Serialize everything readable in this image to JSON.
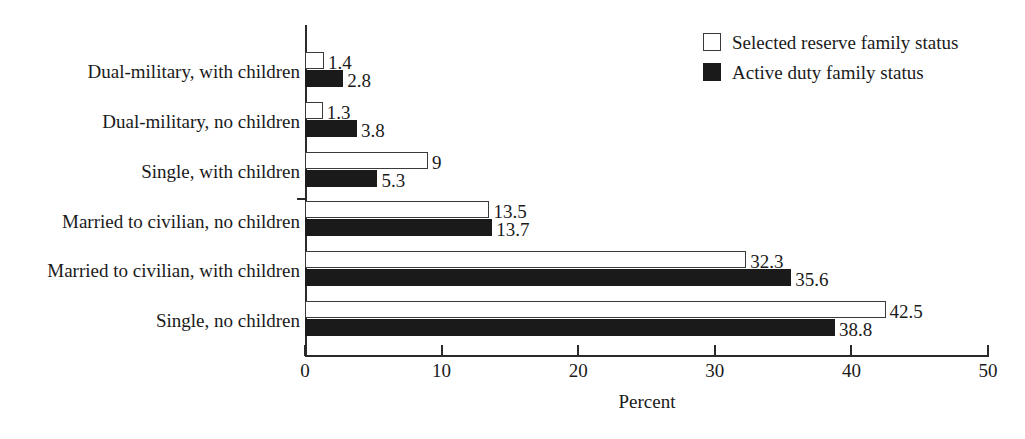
{
  "chart_data": {
    "type": "bar",
    "orientation": "horizontal",
    "title": "",
    "xlabel": "Percent",
    "ylabel": "",
    "xlim": [
      0,
      50
    ],
    "xticks": [
      0,
      10,
      20,
      30,
      40,
      50
    ],
    "xtick_labels": [
      "0",
      "10",
      "20",
      "30",
      "40",
      "50"
    ],
    "grid": false,
    "legend_position": "top-right",
    "categories": [
      "Dual-military, with children",
      "Dual-military, no children",
      "Single, with children",
      "Married to civilian, no children",
      "Married to civilian, with children",
      "Single, no children"
    ],
    "series": [
      {
        "name": "Selected reserve family status",
        "style": "open",
        "color": "#ffffff",
        "edge_color": "#3a3a3a",
        "values": [
          1.4,
          1.3,
          9,
          13.5,
          32.3,
          42.5
        ],
        "value_labels": [
          "1.4",
          "1.3",
          "9",
          "13.5",
          "32.3",
          "42.5"
        ]
      },
      {
        "name": "Active duty family status",
        "style": "filled",
        "color": "#1a1a1a",
        "edge_color": "#1a1a1a",
        "values": [
          2.8,
          3.8,
          5.3,
          13.7,
          35.6,
          38.8
        ],
        "value_labels": [
          "2.8",
          "3.8",
          "5.3",
          "13.7",
          "35.6",
          "38.8"
        ]
      }
    ]
  },
  "legend": {
    "entries": [
      {
        "label": "Selected reserve family status",
        "swatch": "open-square-swatch"
      },
      {
        "label": "Active duty family status",
        "swatch": "filled-square-swatch"
      }
    ]
  },
  "axis": {
    "x_title": "Percent"
  }
}
